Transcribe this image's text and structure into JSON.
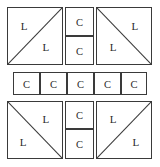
{
  "figure": {
    "type": "quilt-block-layout-diagram",
    "width": 160,
    "height": 167,
    "stroke_color": "#3a3a3a",
    "background_color": "#ffffff",
    "text_color": "#2b2b2b"
  },
  "rows": {
    "top": {
      "left_block": {
        "name": "top-left-block",
        "diagonal": "bottom-left-to-top-right",
        "labels": [
          {
            "text": "L",
            "x": 22,
            "y": 45
          },
          {
            "text": "L",
            "x": 62,
            "y": 78
          }
        ]
      },
      "center_column": {
        "name": "top-center-column",
        "cells": [
          {
            "text": "C"
          },
          {
            "text": "C"
          }
        ]
      },
      "right_block": {
        "name": "top-right-block",
        "diagonal": "top-left-to-bottom-right",
        "labels": [
          {
            "text": "L",
            "x": 22,
            "y": 78
          },
          {
            "text": "L",
            "x": 62,
            "y": 45
          }
        ]
      }
    },
    "middle_strip": {
      "name": "middle-strip",
      "cells": [
        {
          "text": "C"
        },
        {
          "text": "C"
        },
        {
          "text": "C"
        },
        {
          "text": "C"
        },
        {
          "text": "C"
        }
      ]
    },
    "bottom": {
      "left_block": {
        "name": "bottom-left-block",
        "diagonal": "top-left-to-bottom-right",
        "labels": [
          {
            "text": "L",
            "x": 20,
            "y": 75
          },
          {
            "text": "L",
            "x": 62,
            "y": 42
          }
        ]
      },
      "center_column": {
        "name": "bottom-center-column",
        "cells": [
          {
            "text": "C"
          },
          {
            "text": "C"
          }
        ]
      },
      "right_block": {
        "name": "bottom-right-block",
        "diagonal": "bottom-left-to-top-right",
        "labels": [
          {
            "text": "L",
            "x": 22,
            "y": 42
          },
          {
            "text": "L",
            "x": 62,
            "y": 75
          }
        ]
      }
    }
  }
}
